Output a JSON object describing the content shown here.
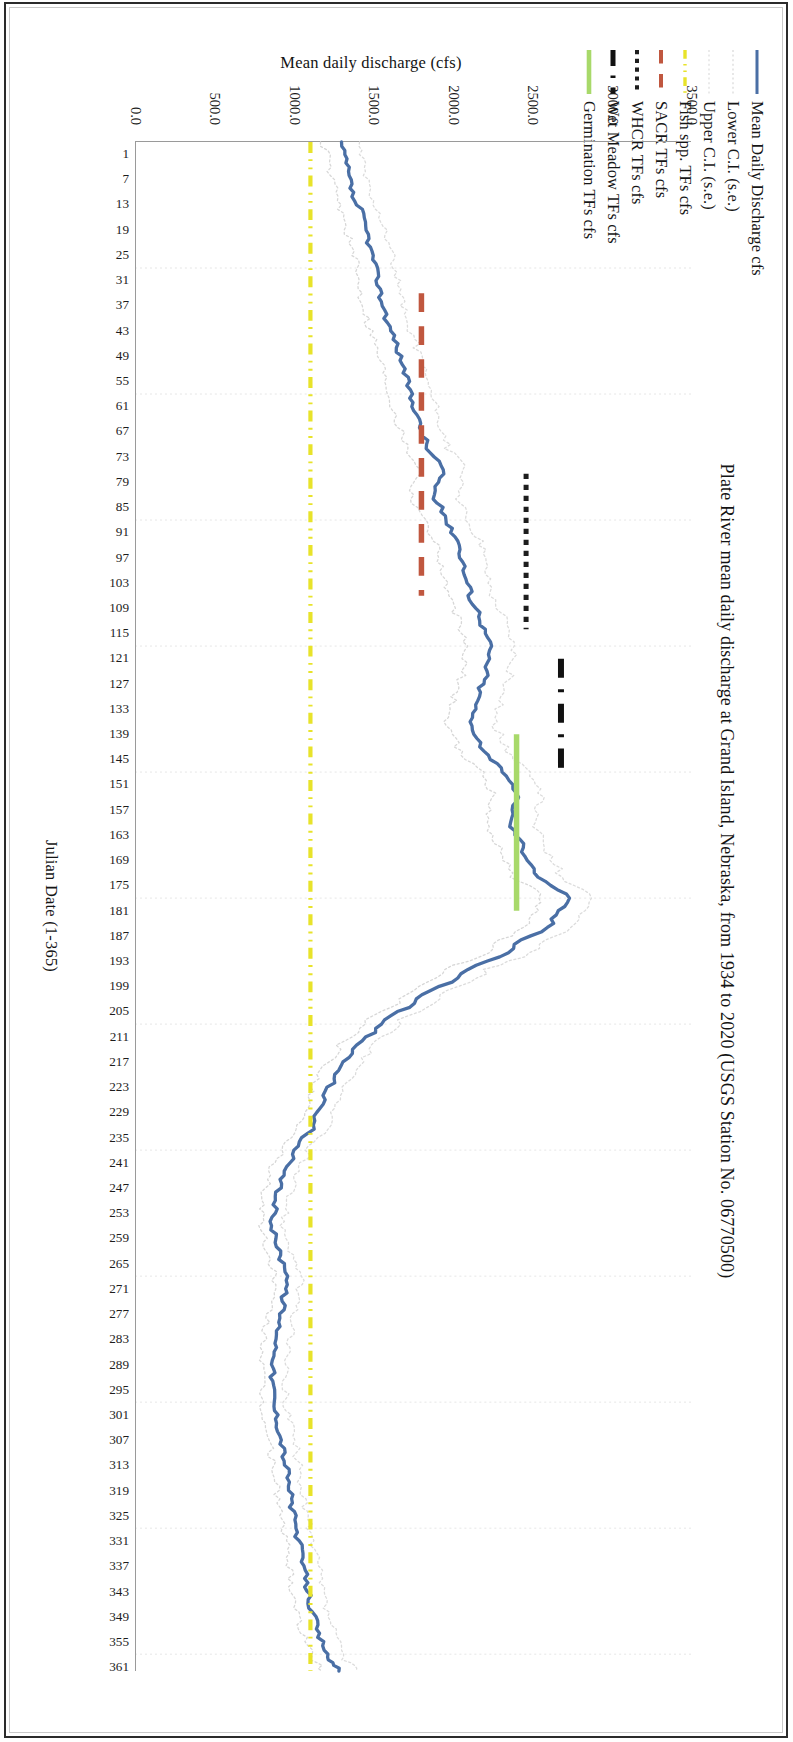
{
  "figure": {
    "title": "Plate River mean daily discharge at Grand Island, Nebraska, from 1934 to 2020 (USGS Station No. 06770500)"
  },
  "legend": {
    "items": [
      {
        "label": "Mean Daily Discharge cfs",
        "color": "#4a6fa5",
        "style": "solid",
        "width": 3.0
      },
      {
        "label": "Lower C.I. (s.e.)",
        "color": "#d7d7d7",
        "style": "dotted-fine",
        "width": 1.2
      },
      {
        "label": "Upper C.I. (s.e.)",
        "color": "#dcdcdc",
        "style": "dotted-fine",
        "width": 1.2
      },
      {
        "label": "Fish spp. TFs cfs",
        "color": "#e8e32a",
        "style": "dash-dot-dot",
        "width": 3.4
      },
      {
        "label": "SACR TFs cfs",
        "color": "#c0573f",
        "style": "dashed",
        "width": 4.0
      },
      {
        "label": "WHCR TFs cfs",
        "color": "#1d1d1d",
        "style": "dotted",
        "width": 4.0
      },
      {
        "label": "Wet Meadow TFs cfs",
        "color": "#111111",
        "style": "dash-dot",
        "width": 5.0
      },
      {
        "label": "Germination TFs cfs",
        "color": "#a8d96a",
        "style": "solid",
        "width": 4.6
      }
    ]
  },
  "axes": {
    "y": {
      "title": "Mean daily discharge (cfs)",
      "ticks": [
        "3500.0",
        "3000.0",
        "2500.0",
        "2000.0",
        "1500.0",
        "1000.0",
        "500.0",
        "0.0"
      ],
      "min": 0,
      "max": 3500
    },
    "x": {
      "title": "Julian Date (1-365)",
      "min": 1,
      "max": 365,
      "ticks": [
        1,
        7,
        13,
        19,
        25,
        31,
        37,
        43,
        49,
        55,
        61,
        67,
        73,
        79,
        85,
        91,
        97,
        103,
        109,
        115,
        121,
        127,
        133,
        139,
        145,
        151,
        157,
        163,
        169,
        175,
        181,
        187,
        193,
        199,
        205,
        211,
        217,
        223,
        229,
        235,
        241,
        247,
        253,
        259,
        265,
        271,
        277,
        283,
        289,
        295,
        301,
        307,
        313,
        319,
        325,
        331,
        337,
        343,
        349,
        355,
        361
      ]
    }
  },
  "chart_data": {
    "type": "line",
    "title": "Plate River mean daily discharge at Grand Island, Nebraska, from 1934 to 2020 (USGS Station No. 06770500)",
    "xlabel": "Julian Date (1-365)",
    "ylabel": "Mean daily discharge (cfs)",
    "xlim": [
      1,
      365
    ],
    "ylim": [
      0,
      3500
    ],
    "grid": "vertical-light",
    "legend_position": "top-left-outside",
    "x": [
      1,
      7,
      13,
      19,
      25,
      31,
      37,
      43,
      49,
      55,
      61,
      67,
      73,
      79,
      85,
      91,
      97,
      103,
      109,
      115,
      121,
      127,
      133,
      139,
      145,
      151,
      157,
      163,
      169,
      175,
      181,
      187,
      193,
      199,
      205,
      211,
      217,
      223,
      229,
      235,
      241,
      247,
      253,
      259,
      265,
      271,
      277,
      283,
      289,
      295,
      301,
      307,
      313,
      319,
      325,
      331,
      337,
      343,
      349,
      355,
      361,
      365
    ],
    "series": [
      {
        "name": "Mean Daily Discharge cfs",
        "color": "#4a6fa5",
        "style": "solid",
        "values": [
          1290,
          1330,
          1360,
          1430,
          1470,
          1510,
          1540,
          1580,
          1640,
          1690,
          1730,
          1780,
          1830,
          1930,
          1880,
          1960,
          2040,
          2070,
          2110,
          2180,
          2230,
          2210,
          2160,
          2110,
          2180,
          2320,
          2400,
          2360,
          2440,
          2520,
          2720,
          2620,
          2380,
          2060,
          1780,
          1540,
          1370,
          1260,
          1180,
          1120,
          1000,
          920,
          880,
          860,
          900,
          960,
          930,
          900,
          880,
          860,
          870,
          900,
          930,
          960,
          980,
          1010,
          1040,
          1070,
          1100,
          1140,
          1200,
          1280
        ]
      },
      {
        "name": "Lower C.I. (s.e.)",
        "color": "#d7d7d7",
        "style": "dotted-fine",
        "values": [
          1180,
          1220,
          1250,
          1310,
          1350,
          1390,
          1420,
          1460,
          1510,
          1560,
          1600,
          1650,
          1700,
          1790,
          1740,
          1820,
          1900,
          1930,
          1970,
          2030,
          2080,
          2060,
          2010,
          1960,
          2030,
          2170,
          2250,
          2210,
          2290,
          2370,
          2560,
          2470,
          2240,
          1930,
          1660,
          1430,
          1270,
          1160,
          1080,
          1030,
          910,
          840,
          800,
          790,
          820,
          880,
          850,
          820,
          800,
          790,
          790,
          820,
          850,
          880,
          900,
          930,
          950,
          980,
          1010,
          1040,
          1100,
          1170
        ]
      },
      {
        "name": "Upper C.I. (s.e.)",
        "color": "#dcdcdc",
        "style": "dotted-fine",
        "values": [
          1400,
          1440,
          1470,
          1550,
          1590,
          1630,
          1660,
          1700,
          1770,
          1820,
          1860,
          1910,
          1960,
          2070,
          2020,
          2100,
          2180,
          2210,
          2250,
          2330,
          2380,
          2360,
          2310,
          2260,
          2330,
          2470,
          2550,
          2510,
          2590,
          2670,
          2880,
          2770,
          2520,
          2190,
          1900,
          1650,
          1470,
          1360,
          1280,
          1210,
          1090,
          1000,
          960,
          930,
          980,
          1040,
          1010,
          980,
          960,
          930,
          950,
          980,
          1010,
          1040,
          1060,
          1090,
          1130,
          1160,
          1190,
          1240,
          1300,
          1390
        ]
      }
    ],
    "threshold_lines": [
      {
        "name": "Fish spp. TFs cfs",
        "color": "#e8e32a",
        "style": "dash-dot-dot",
        "orientation": "horizontal",
        "value": 1100,
        "x_start": 1,
        "x_end": 365
      },
      {
        "name": "SACR TFs cfs",
        "color": "#c0573f",
        "style": "dashed",
        "orientation": "horizontal",
        "value": 1800,
        "x_start": 37,
        "x_end": 109
      },
      {
        "name": "WHCR TFs cfs",
        "color": "#1d1d1d",
        "style": "dotted",
        "orientation": "horizontal",
        "value": 2460,
        "x_start": 80,
        "x_end": 117
      },
      {
        "name": "Wet Meadow TFs cfs",
        "color": "#111111",
        "style": "dash-dot",
        "orientation": "horizontal",
        "value": 2680,
        "x_start": 124,
        "x_end": 152
      },
      {
        "name": "Germination TFs cfs",
        "color": "#a8d96a",
        "style": "solid",
        "orientation": "horizontal",
        "value": 2400,
        "x_start": 142,
        "x_end": 184
      }
    ]
  }
}
